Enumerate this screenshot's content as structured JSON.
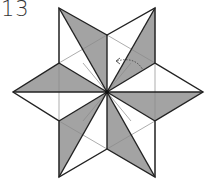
{
  "diagram": {
    "step_number": "13",
    "colors": {
      "fill": "#a3a3a3",
      "stroke": "#222222",
      "thin": "#8a8a8a",
      "paper": "#ffffff"
    },
    "center": [
      107,
      92
    ],
    "outer_points": [
      [
        59,
        8
      ],
      [
        155,
        8
      ],
      [
        203,
        92
      ],
      [
        155,
        177
      ],
      [
        59,
        177
      ],
      [
        13,
        92
      ]
    ],
    "inner_hexagon": [
      [
        107,
        35
      ],
      [
        155,
        63
      ],
      [
        155,
        121
      ],
      [
        107,
        149
      ],
      [
        59,
        121
      ],
      [
        59,
        63
      ]
    ],
    "annotation": "curved dashed fold arrow"
  }
}
